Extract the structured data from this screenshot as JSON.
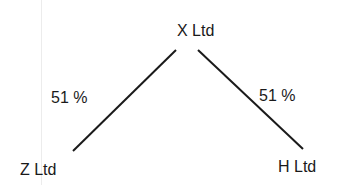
{
  "diagram": {
    "nodes": [
      {
        "id": "x",
        "label": "X Ltd"
      },
      {
        "id": "z",
        "label": "Z Ltd"
      },
      {
        "id": "h",
        "label": "H Ltd"
      }
    ],
    "edges": [
      {
        "from": "x",
        "to": "z",
        "label": "51 %"
      },
      {
        "from": "x",
        "to": "h",
        "label": "51 %"
      }
    ]
  }
}
